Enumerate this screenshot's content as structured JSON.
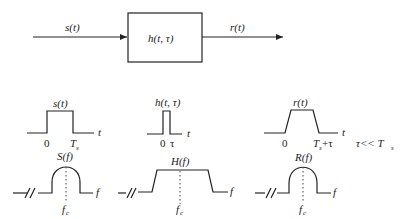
{
  "block_diagram": {
    "input_label": "s(t)",
    "system_label": "h(t, τ)",
    "output_label": "r(t)"
  },
  "panels": [
    {
      "id": "input",
      "time_label": "s(t)",
      "time_axis": "t",
      "time_ticks": [
        "0",
        "T",
        "s"
      ],
      "freq_label": "S(f)",
      "freq_axis": "f",
      "freq_center": "f",
      "freq_center_sub": "c"
    },
    {
      "id": "channel",
      "time_label": "h(t, τ)",
      "time_axis": "t",
      "time_ticks": [
        "0",
        "τ"
      ],
      "freq_label": "H(f)",
      "freq_axis": "f",
      "freq_center": "f",
      "freq_center_sub": "c"
    },
    {
      "id": "output",
      "time_label": "r(t)",
      "time_axis": "t",
      "time_ticks": [
        "0",
        "T",
        "s",
        "+τ"
      ],
      "freq_label": "R(f)",
      "freq_axis": "f",
      "freq_center": "f",
      "freq_center_sub": "c"
    }
  ],
  "condition": {
    "lhs": "τ<< T",
    "sub": "s"
  }
}
